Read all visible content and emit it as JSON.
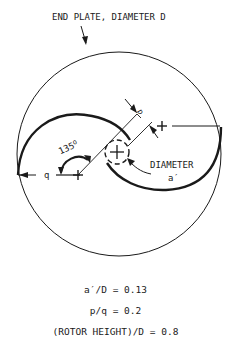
{
  "title_label": "END PLATE, DIAMETER D",
  "labels": {
    "angle": "135",
    "angle_unit": "o",
    "q": "q",
    "p": "p",
    "diameter": "DIAMETER",
    "a_prime": "a′",
    "minus": "-",
    "plus": "+"
  },
  "equations": [
    "a′/D = 0.13",
    "p/q = 0.2",
    "(ROTOR HEIGHT)/D = 0.8"
  ],
  "parameters": {
    "a_prime_over_D": 0.13,
    "p_over_q": 0.2,
    "rotor_height_over_D": 0.8,
    "angle_deg": 135
  },
  "colors": {
    "ink": "#1a1a1a",
    "background": "#ffffff"
  }
}
